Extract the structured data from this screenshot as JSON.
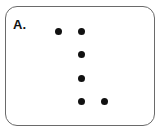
{
  "panel": {
    "label": "A.",
    "dots": [
      {
        "x": 58,
        "y": 31
      },
      {
        "x": 81,
        "y": 31
      },
      {
        "x": 81,
        "y": 54
      },
      {
        "x": 81,
        "y": 78
      },
      {
        "x": 81,
        "y": 101
      },
      {
        "x": 104,
        "y": 101
      }
    ],
    "dot_color": "#111111",
    "border_color": "#6a6a6a"
  }
}
